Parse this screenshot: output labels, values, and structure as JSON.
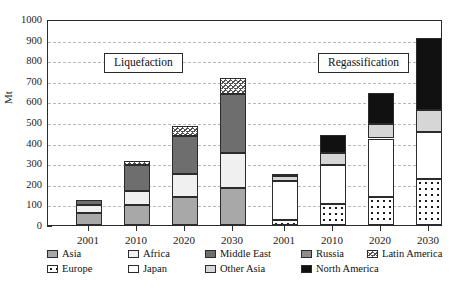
{
  "chart_data": {
    "type": "bar",
    "stacked": true,
    "title": "",
    "xlabel": "",
    "ylabel": "Mt",
    "ylim": [
      0,
      1000
    ],
    "ytick_step": 100,
    "yticks": [
      "1000",
      "900",
      "800",
      "700",
      "600",
      "500",
      "400",
      "300",
      "200",
      "100",
      "0"
    ],
    "grid": true,
    "legend_position": "bottom",
    "panels": [
      {
        "name": "Liquefaction",
        "label": "Liquefaction",
        "categories": [
          "2001",
          "2010",
          "2020",
          "2030"
        ],
        "series": [
          {
            "name": "Asia",
            "values": [
              60,
              95,
              135,
              180
            ]
          },
          {
            "name": "Africa",
            "values": [
              35,
              70,
              115,
              170
            ]
          },
          {
            "name": "Middle East",
            "values": [
              25,
              125,
              180,
              285
            ]
          },
          {
            "name": "Latin America",
            "values": [
              0,
              20,
              50,
              80
            ]
          }
        ],
        "totals": [
          120,
          310,
          480,
          715
        ]
      },
      {
        "name": "Regassification",
        "label": "Regassification",
        "categories": [
          "2001",
          "2010",
          "2020",
          "2030"
        ],
        "series": [
          {
            "name": "Europe",
            "values": [
              25,
              100,
              135,
              225
            ]
          },
          {
            "name": "Japan",
            "values": [
              190,
              190,
              285,
              225
            ]
          },
          {
            "name": "Other Asia",
            "values": [
              25,
              60,
              70,
              110
            ]
          },
          {
            "name": "North America",
            "values": [
              10,
              85,
              150,
              350
            ]
          }
        ],
        "totals": [
          250,
          435,
          640,
          910
        ]
      }
    ],
    "legend": [
      {
        "label": "Asia",
        "key": "f-asia",
        "color": "#a8a8a8"
      },
      {
        "label": "Africa",
        "key": "f-africa",
        "color": "#f0f0f0"
      },
      {
        "label": "Middle East",
        "key": "f-mideast",
        "color": "#6e6e6e"
      },
      {
        "label": "Russia",
        "key": "f-russia",
        "color": "#8d8d8d"
      },
      {
        "label": "Latin America",
        "key": "f-latin",
        "color": "#555555"
      },
      {
        "label": "Europe",
        "key": "f-europe",
        "color": "#1c1c1c"
      },
      {
        "label": "Japan",
        "key": "f-japan",
        "color": "#ffffff"
      },
      {
        "label": "Other Asia",
        "key": "f-otherasia",
        "color": "#d6d6d6"
      },
      {
        "label": "North America",
        "key": "f-northamerica",
        "color": "#111111"
      }
    ]
  },
  "callouts": {
    "left": "Liquefaction",
    "right": "Regassification"
  },
  "axis": {
    "ylabel": "Mt"
  }
}
